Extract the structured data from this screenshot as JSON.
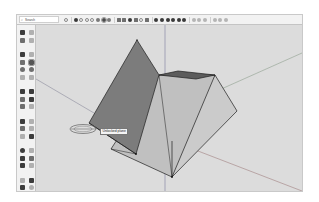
{
  "app": {
    "name": "3D modeling application"
  },
  "toolbar": {
    "search": {
      "icon": "search-icon",
      "value": "Search"
    },
    "icons": [
      "select-icon",
      "eraser-icon",
      "orbit-icon",
      "pan-icon",
      "zoom-icon",
      "zoom-extents-icon",
      "push-pull-icon",
      "move-icon",
      "rotate-icon",
      "scale-icon",
      "follow-me-icon",
      "offset-icon",
      "tape-measure-icon",
      "paint-bucket-icon",
      "rectangle-icon",
      "circle-icon",
      "polygon-icon",
      "arc-icon",
      "line-icon",
      "freehand-icon",
      "text-icon",
      "axes-icon",
      "section-plane-icon",
      "walk-icon",
      "look-around-icon",
      "position-camera-icon"
    ],
    "active_icon_index": 6
  },
  "left_toolbar": {
    "icons": [
      "select-icon",
      "component-icon",
      "paint-bucket-icon",
      "eraser-icon",
      "line-icon",
      "freehand-icon",
      "rectangle-icon",
      "rotated-rectangle-icon",
      "circle-icon",
      "polygon-icon",
      "arc-icon",
      "pie-icon",
      "move-icon",
      "push-pull-icon",
      "rotate-icon",
      "follow-me-icon",
      "scale-icon",
      "offset-icon",
      "tape-measure-icon",
      "dimension-icon",
      "protractor-icon",
      "text-icon",
      "axes-icon",
      "3d-text-icon",
      "orbit-icon",
      "pan-icon",
      "zoom-icon",
      "zoom-window-icon",
      "zoom-extents-icon",
      "previous-view-icon",
      "walk-icon",
      "look-around-icon",
      "section-plane-icon",
      "position-camera-icon"
    ]
  },
  "canvas": {
    "tooltip": "Unlocked plane",
    "colors": {
      "background": "#dcdcdc",
      "face_light": "#c8c8c8",
      "face_mid": "#b9b9b9",
      "face_dark": "#7a7a7a",
      "face_top": "#5a5a5a",
      "edge": "#1e1e1e",
      "axis_red": "#a07878",
      "axis_green": "#7f9a7f",
      "axis_blue": "#8a8aa6"
    }
  }
}
